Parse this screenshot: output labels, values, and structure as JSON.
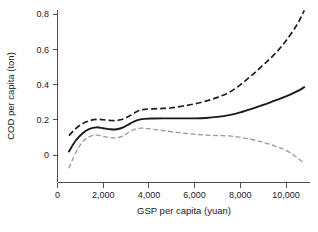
{
  "chart_data": {
    "type": "line",
    "title": "",
    "subtitle": "",
    "xlabel": "GSP per capita (yuan)",
    "ylabel": "COD per capita (ton)",
    "xlim": [
      0,
      11000
    ],
    "ylim": [
      -0.1,
      0.86
    ],
    "grid": false,
    "legend_position": "none",
    "x_ticks": [
      0,
      2000,
      4000,
      6000,
      8000,
      10000
    ],
    "x_tick_labels": [
      "0",
      "2,000",
      "4,000",
      "6,000",
      "8,000",
      "10,000"
    ],
    "y_ticks": [
      0,
      0.2,
      0.4,
      0.6,
      0.8
    ],
    "y_tick_labels": [
      "0",
      "0.2",
      "0.4",
      "0.6",
      "0.8"
    ],
    "x": [
      500,
      800,
      1100,
      1400,
      1700,
      2000,
      2300,
      2600,
      2900,
      3200,
      3500,
      3800,
      4200,
      4600,
      5000,
      5500,
      6000,
      6500,
      7000,
      7500,
      8000,
      8500,
      9000,
      9500,
      10000,
      10500,
      10800
    ],
    "series": [
      {
        "name": "Upper confidence bound",
        "style": "dashed",
        "color": "#1f1f1f",
        "values": [
          0.11,
          0.15,
          0.178,
          0.194,
          0.202,
          0.2,
          0.196,
          0.196,
          0.205,
          0.225,
          0.248,
          0.259,
          0.262,
          0.264,
          0.268,
          0.278,
          0.29,
          0.306,
          0.327,
          0.355,
          0.398,
          0.452,
          0.51,
          0.572,
          0.648,
          0.744,
          0.82
        ]
      },
      {
        "name": "Fitted curve",
        "style": "solid",
        "color": "#1a1a1a",
        "values": [
          0.02,
          0.082,
          0.124,
          0.148,
          0.157,
          0.152,
          0.146,
          0.146,
          0.158,
          0.18,
          0.198,
          0.205,
          0.207,
          0.208,
          0.208,
          0.208,
          0.208,
          0.21,
          0.216,
          0.226,
          0.242,
          0.262,
          0.284,
          0.308,
          0.332,
          0.362,
          0.385
        ]
      },
      {
        "name": "Lower confidence bound",
        "style": "dashed",
        "color": "#9a9a9a",
        "values": [
          -0.075,
          0.014,
          0.075,
          0.104,
          0.113,
          0.106,
          0.098,
          0.098,
          0.11,
          0.135,
          0.15,
          0.152,
          0.146,
          0.139,
          0.132,
          0.124,
          0.118,
          0.113,
          0.11,
          0.108,
          0.1,
          0.088,
          0.072,
          0.052,
          0.026,
          -0.016,
          -0.05
        ]
      }
    ]
  }
}
